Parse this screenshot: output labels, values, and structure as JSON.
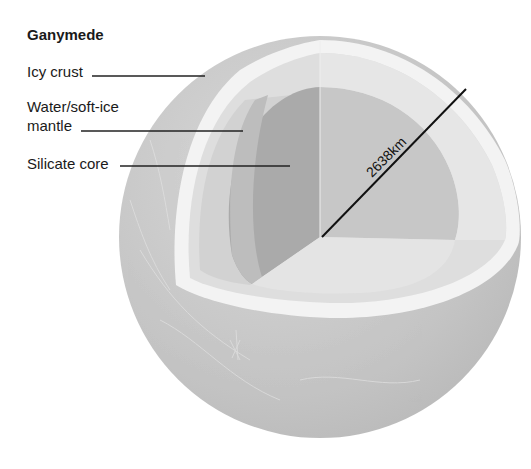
{
  "diagram": {
    "title": "Ganymede",
    "labels": [
      {
        "id": "icy-crust",
        "text": "Icy crust"
      },
      {
        "id": "mantle",
        "lines": [
          "Water/soft-ice",
          "mantle"
        ]
      },
      {
        "id": "core",
        "text": "Silicate core"
      }
    ],
    "radius_label": "2638km",
    "colors": {
      "background": "#ffffff",
      "surface": "#c9c9c9",
      "crust_rim": "#f2f2f2",
      "mantle_cut": "#dcdcdc",
      "core_shaded": "#a9a9a9",
      "core_light": "#c6c6c6",
      "line": "#111111"
    }
  }
}
